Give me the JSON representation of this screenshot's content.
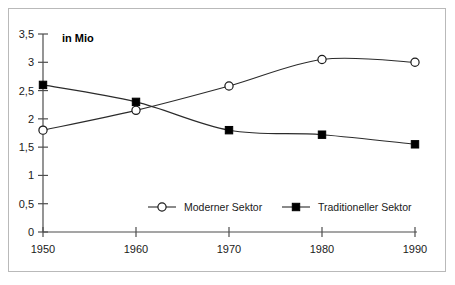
{
  "chart_data": {
    "type": "line",
    "title": "",
    "subtitle": "",
    "unit_label": "in Mio",
    "xlabel": "",
    "ylabel": "",
    "categories": [
      "1950",
      "1960",
      "1970",
      "1980",
      "1990"
    ],
    "x": [
      1950,
      1960,
      1970,
      1980,
      1990
    ],
    "xlim": [
      1950,
      1990
    ],
    "ylim": [
      0,
      3.5
    ],
    "y_ticks": [
      0,
      0.5,
      1,
      1.5,
      2,
      2.5,
      3,
      3.5
    ],
    "y_tick_labels": [
      "0",
      "0,5",
      "1",
      "1,5",
      "2",
      "2,5",
      "3",
      "3,5"
    ],
    "x_tick_labels": [
      "1950",
      "1960",
      "1970",
      "1980",
      "1990"
    ],
    "grid": false,
    "legend_position": "inside-bottom-center",
    "decimal_separator": ",",
    "series": [
      {
        "name": "Moderner Sektor",
        "marker": "open-circle",
        "color": "#1a1a1a",
        "values": [
          1.8,
          2.15,
          2.58,
          3.05,
          3.0
        ]
      },
      {
        "name": "Traditioneller Sektor",
        "marker": "filled-square",
        "color": "#000000",
        "values": [
          2.6,
          2.3,
          1.8,
          1.72,
          1.55
        ]
      }
    ]
  },
  "legend": {
    "items": [
      {
        "label": "Moderner Sektor",
        "marker": "open-circle"
      },
      {
        "label": "Traditioneller Sektor",
        "marker": "filled-square"
      }
    ]
  },
  "colors": {
    "background": "#ffffff",
    "frame_border": "#b9b9b9",
    "axis": "#4d4d4d",
    "line": "#2b2b2b",
    "text": "#1a1a1a"
  }
}
